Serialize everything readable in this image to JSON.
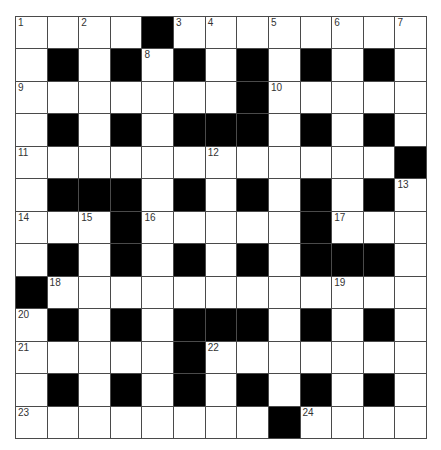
{
  "puzzle": {
    "rows": 13,
    "cols": 13,
    "colors": {
      "line": "#4a4a4a",
      "block": "#000000",
      "cell": "#ffffff",
      "number": "#333333"
    },
    "layout": [
      "....#........",
      ".#.#.#.#.#.#.",
      ".......#.....",
      ".#.#.###.#.#.",
      "............#",
      ".###.#.#.#.#.",
      "...#.....#...",
      ".#.#.#.#.###.",
      "#............",
      ".#.#.###.#.#.",
      ".....#.......",
      ".#.#.#.#.#.#.",
      "........#...."
    ],
    "numbers": [
      {
        "r": 0,
        "c": 0,
        "n": "1"
      },
      {
        "r": 0,
        "c": 2,
        "n": "2"
      },
      {
        "r": 0,
        "c": 5,
        "n": "3"
      },
      {
        "r": 0,
        "c": 6,
        "n": "4"
      },
      {
        "r": 0,
        "c": 8,
        "n": "5"
      },
      {
        "r": 0,
        "c": 10,
        "n": "6"
      },
      {
        "r": 0,
        "c": 12,
        "n": "7"
      },
      {
        "r": 1,
        "c": 4,
        "n": "8"
      },
      {
        "r": 2,
        "c": 0,
        "n": "9"
      },
      {
        "r": 2,
        "c": 8,
        "n": "10"
      },
      {
        "r": 4,
        "c": 0,
        "n": "11"
      },
      {
        "r": 4,
        "c": 6,
        "n": "12"
      },
      {
        "r": 5,
        "c": 12,
        "n": "13"
      },
      {
        "r": 6,
        "c": 0,
        "n": "14"
      },
      {
        "r": 6,
        "c": 2,
        "n": "15"
      },
      {
        "r": 6,
        "c": 4,
        "n": "16"
      },
      {
        "r": 6,
        "c": 10,
        "n": "17"
      },
      {
        "r": 8,
        "c": 1,
        "n": "18"
      },
      {
        "r": 8,
        "c": 10,
        "n": "19"
      },
      {
        "r": 9,
        "c": 0,
        "n": "20"
      },
      {
        "r": 10,
        "c": 0,
        "n": "21"
      },
      {
        "r": 10,
        "c": 6,
        "n": "22"
      },
      {
        "r": 12,
        "c": 0,
        "n": "23"
      },
      {
        "r": 12,
        "c": 9,
        "n": "24"
      }
    ]
  }
}
